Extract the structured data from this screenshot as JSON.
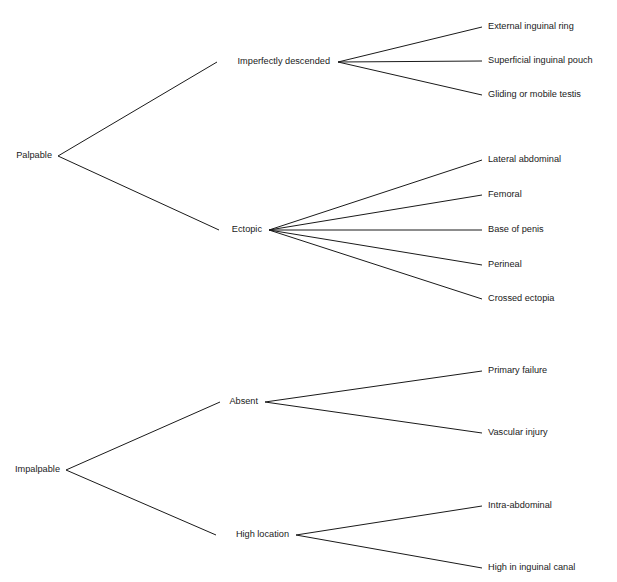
{
  "diagram": {
    "type": "tree",
    "orientation": "left-to-right",
    "background_color": "#ffffff",
    "line_color": "#1a1a1a",
    "text_color": "#1a1a1a",
    "trees": [
      {
        "id": "palpable-tree",
        "root": {
          "label": "Palpable",
          "x": 52,
          "y": 156,
          "anchor": "end"
        },
        "branches": [
          {
            "label": "Imperfectly descended",
            "x": 330,
            "y": 62,
            "anchor": "end",
            "fan_x": 338,
            "leaves": [
              {
                "label": "External inguinal ring",
                "x": 488,
                "y": 27,
                "line_end_x": 482
              },
              {
                "label": "Superficial inguinal pouch",
                "x": 488,
                "y": 61,
                "line_end_x": 482
              },
              {
                "label": "Gliding or mobile testis",
                "x": 488,
                "y": 95,
                "line_end_x": 482
              }
            ]
          },
          {
            "label": "Ectopic",
            "x": 262,
            "y": 230,
            "anchor": "end",
            "fan_x": 269,
            "leaves": [
              {
                "label": "Lateral abdominal",
                "x": 488,
                "y": 160,
                "line_end_x": 482
              },
              {
                "label": "Femoral",
                "x": 488,
                "y": 195,
                "line_end_x": 482
              },
              {
                "label": "Base of penis",
                "x": 488,
                "y": 230,
                "line_end_x": 482
              },
              {
                "label": "Perineal",
                "x": 488,
                "y": 265,
                "line_end_x": 482
              },
              {
                "label": "Crossed ectopia",
                "x": 488,
                "y": 299,
                "line_end_x": 482
              }
            ]
          }
        ]
      },
      {
        "id": "impalpable-tree",
        "root": {
          "label": "Impalpable",
          "x": 60,
          "y": 470,
          "anchor": "end"
        },
        "branches": [
          {
            "label": "Absent",
            "x": 258,
            "y": 402,
            "anchor": "end",
            "fan_x": 265,
            "leaves": [
              {
                "label": "Primary failure",
                "x": 488,
                "y": 371,
                "line_end_x": 482
              },
              {
                "label": "Vascular injury",
                "x": 488,
                "y": 433,
                "line_end_x": 482
              }
            ]
          },
          {
            "label": "High location",
            "x": 289,
            "y": 535,
            "anchor": "end",
            "fan_x": 296,
            "leaves": [
              {
                "label": "Intra-abdominal",
                "x": 488,
                "y": 506,
                "line_end_x": 482
              },
              {
                "label": "High in inguinal canal",
                "x": 488,
                "y": 568,
                "line_end_x": 482
              }
            ]
          }
        ]
      }
    ]
  },
  "labels": {
    "palpable": "Palpable",
    "impalpable": "Impalpable",
    "imperfectly_descended": "Imperfectly descended",
    "ectopic": "Ectopic",
    "absent": "Absent",
    "high_location": "High location",
    "external_inguinal_ring": "External inguinal ring",
    "superficial_inguinal_pouch": "Superficial inguinal pouch",
    "gliding_or_mobile_testis": "Gliding or mobile testis",
    "lateral_abdominal": "Lateral abdominal",
    "femoral": "Femoral",
    "base_of_penis": "Base of penis",
    "perineal": "Perineal",
    "crossed_ectopia": "Crossed ectopia",
    "primary_failure": "Primary failure",
    "vascular_injury": "Vascular injury",
    "intra_abdominal": "Intra-abdominal",
    "high_in_inguinal_canal": "High in inguinal canal"
  }
}
